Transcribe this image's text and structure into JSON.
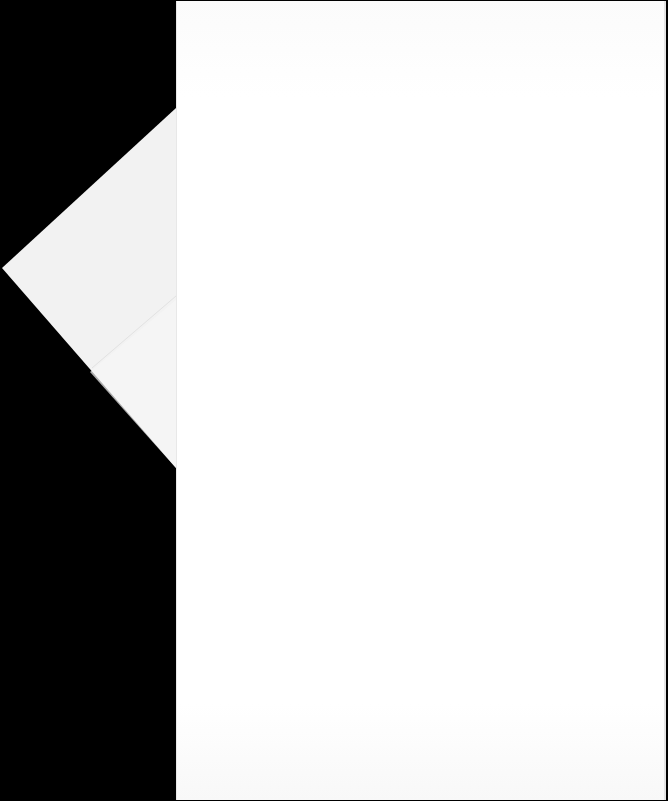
{
  "scene": {
    "description": "Blank white sheet of paper with a folded triangular corner flap, on black background",
    "background_color": "#000000",
    "paper_color": "#ffffff",
    "flap_color": "#f3f3f3",
    "text_content": []
  }
}
